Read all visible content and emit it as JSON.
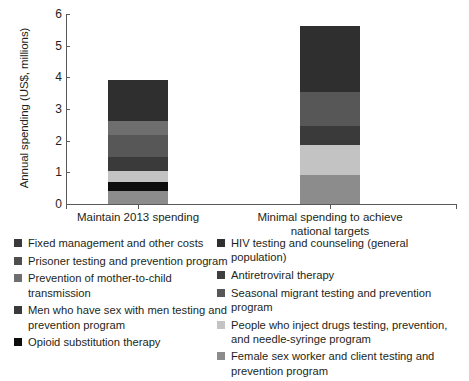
{
  "chart_data": {
    "type": "bar",
    "subtype": "stacked-bar",
    "title": "",
    "xlabel": "",
    "ylabel": "Annual spending (US$, millions)",
    "ylim": [
      0,
      6
    ],
    "yticks": [
      0,
      1,
      2,
      3,
      4,
      5,
      6
    ],
    "ytick_labels": [
      "0",
      "1",
      "2",
      "3",
      "4",
      "5",
      "6"
    ],
    "grid": false,
    "legend_position": "bottom",
    "categories": [
      "Maintain 2013 spending",
      "Minimal spending to achieve national targets"
    ],
    "category_totals": [
      3.93,
      5.62
    ],
    "series": [
      {
        "name": "Female sex worker and client testing and prevention program",
        "color": "#8c8c8c",
        "values": [
          0.42,
          0.93
        ]
      },
      {
        "name": "Opioid substitution therapy",
        "color": "#0d0d0d",
        "values": [
          0.28,
          0.0
        ]
      },
      {
        "name": "People who inject drugs testing, prevention, and needle-syringe program",
        "color": "#c3c3c3",
        "values": [
          0.33,
          0.93
        ]
      },
      {
        "name": "Men who have sex with men testing and prevention program",
        "color": "#3a3a3a",
        "values": [
          0.45,
          0.59
        ]
      },
      {
        "name": "Seasonal migrant testing and prevention program",
        "color": "#575757",
        "values": [
          0.69,
          1.1
        ]
      },
      {
        "name": "Prevention of mother-to-child transmission",
        "color": "#6e6e6e",
        "values": [
          0.45,
          0.0
        ]
      },
      {
        "name": "HIV testing and counseling (general population)",
        "color": "#2f2f2f",
        "values": [
          1.31,
          2.07
        ]
      }
    ]
  },
  "legend": {
    "left_column": [
      {
        "label": "Fixed management and other costs",
        "color": "#3a3a3a"
      },
      {
        "label": "Prisoner testing and prevention program",
        "color": "#4e4e4e"
      },
      {
        "label": "Prevention of mother-to-child transmission",
        "color": "#6e6e6e"
      },
      {
        "label": "Men who have sex with men testing and prevention program",
        "color": "#3a3a3a"
      },
      {
        "label": "Opioid substitution therapy",
        "color": "#0d0d0d"
      }
    ],
    "right_column": [
      {
        "label": "HIV testing and counseling (general population)",
        "color": "#2f2f2f"
      },
      {
        "label": "Antiretroviral therapy",
        "color": "#3f3f3f"
      },
      {
        "label": "Seasonal migrant testing and prevention program",
        "color": "#575757"
      },
      {
        "label": "People who inject drugs testing, prevention, and needle-syringe program",
        "color": "#c3c3c3"
      },
      {
        "label": "Female sex worker and client testing and prevention program",
        "color": "#8c8c8c"
      }
    ]
  },
  "axis": {
    "y_title": "Annual spending (US$, millions)",
    "x_labels": [
      "Maintain 2013 spending",
      "Minimal spending to achieve national targets"
    ]
  },
  "bars": [
    {
      "name": "maintain-2013-spending",
      "total": 3.93,
      "segments": [
        {
          "value": 0.42,
          "color": "#8c8c8c"
        },
        {
          "value": 0.28,
          "color": "#0d0d0d"
        },
        {
          "value": 0.33,
          "color": "#c3c3c3"
        },
        {
          "value": 0.45,
          "color": "#3a3a3a"
        },
        {
          "value": 0.69,
          "color": "#575757"
        },
        {
          "value": 0.45,
          "color": "#6e6e6e"
        },
        {
          "value": 1.31,
          "color": "#2f2f2f"
        }
      ]
    },
    {
      "name": "minimal-spending-national-targets",
      "total": 5.62,
      "segments": [
        {
          "value": 0.93,
          "color": "#8c8c8c"
        },
        {
          "value": 0.93,
          "color": "#c3c3c3"
        },
        {
          "value": 0.59,
          "color": "#3a3a3a"
        },
        {
          "value": 1.1,
          "color": "#575757"
        },
        {
          "value": 2.07,
          "color": "#2f2f2f"
        }
      ]
    }
  ]
}
